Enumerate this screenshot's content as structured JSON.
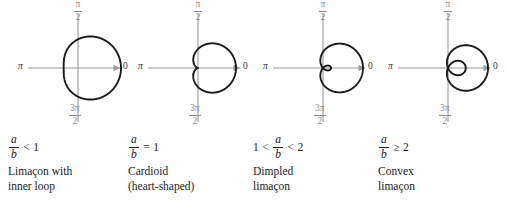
{
  "figure": {
    "axis_labels": {
      "top_num": "π",
      "top_den": "2",
      "bottom_num": "3π",
      "bottom_den": "2",
      "left": "π",
      "right": "0"
    },
    "colors": {
      "curve": "#1a1a1a",
      "axis": "#9a9a9a",
      "axis_label": "#8c8c8c",
      "text": "#1a1a1a",
      "background": "#ffffff"
    }
  },
  "panels": [
    {
      "id": "inner-loop",
      "formula": {
        "numerator": "a",
        "denominator": "b",
        "relation": "<",
        "value": "1",
        "prefix": "",
        "prefix_relation": ""
      },
      "caption": "Limaçon with\ninner loop",
      "ratio": 0.5
    },
    {
      "id": "cardioid",
      "formula": {
        "numerator": "a",
        "denominator": "b",
        "relation": "=",
        "value": "1",
        "prefix": "",
        "prefix_relation": ""
      },
      "caption": "Cardioid\n(heart-shaped)",
      "ratio": 1
    },
    {
      "id": "dimpled",
      "formula": {
        "numerator": "a",
        "denominator": "b",
        "relation": "<",
        "value": "2",
        "prefix": "1",
        "prefix_relation": "<"
      },
      "caption": "Dimpled\nlimaçon",
      "ratio": 1.5
    },
    {
      "id": "convex",
      "formula": {
        "numerator": "a",
        "denominator": "b",
        "relation": "≥",
        "value": "2",
        "prefix": "",
        "prefix_relation": ""
      },
      "caption": "Convex\nlimaçon",
      "ratio": 2.6
    }
  ],
  "chart_data": {
    "type": "line",
    "coordinate_system": "polar",
    "xlabel": "",
    "ylabel": "",
    "grid": false,
    "legend": "none",
    "angle_ticks": [
      "0",
      "π/2",
      "π",
      "3π/2"
    ],
    "series": [
      {
        "name": "Limaçon with inner loop",
        "equation": "r = b + a cos θ",
        "a_over_b": 0.5,
        "condition": "a/b < 1"
      },
      {
        "name": "Cardioid (heart-shaped)",
        "equation": "r = b + a cos θ",
        "a_over_b": 1,
        "condition": "a/b = 1"
      },
      {
        "name": "Dimpled limaçon",
        "equation": "r = b + a cos θ",
        "a_over_b": 1.5,
        "condition": "1 < a/b < 2"
      },
      {
        "name": "Convex limaçon",
        "equation": "r = b + a cos θ",
        "a_over_b": 2.6,
        "condition": "a/b ≥ 2"
      }
    ]
  }
}
